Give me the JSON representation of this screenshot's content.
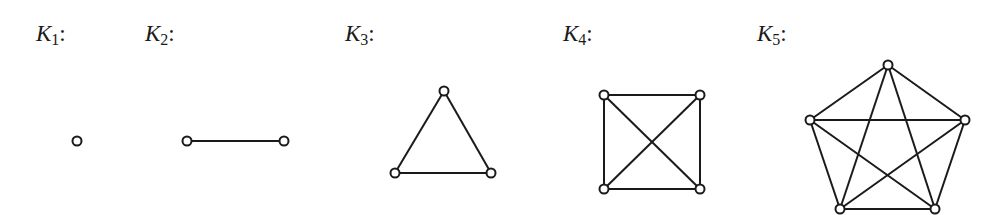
{
  "figure": {
    "graphs": [
      {
        "label_main": "K",
        "label_sub": "1",
        "label_suffix": ":",
        "vertices": 1,
        "edges": 0
      },
      {
        "label_main": "K",
        "label_sub": "2",
        "label_suffix": ":",
        "vertices": 2,
        "edges": 1
      },
      {
        "label_main": "K",
        "label_sub": "3",
        "label_suffix": ":",
        "vertices": 3,
        "edges": 3
      },
      {
        "label_main": "K",
        "label_sub": "4",
        "label_suffix": ":",
        "vertices": 4,
        "edges": 6
      },
      {
        "label_main": "K",
        "label_sub": "5",
        "label_suffix": ":",
        "vertices": 5,
        "edges": 10
      }
    ]
  }
}
